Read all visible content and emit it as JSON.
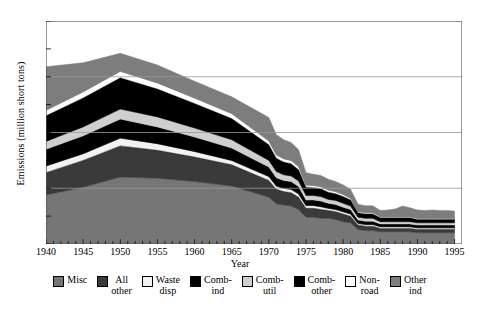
{
  "chart_data": {
    "type": "area",
    "stacked": true,
    "title": "",
    "xlabel": "Year",
    "ylabel": "Emissions (million short tons)",
    "xlim": [
      1940,
      1996
    ],
    "ylim": [
      0,
      20
    ],
    "yticks": [
      0,
      5,
      10,
      15,
      20
    ],
    "xticks": [
      1940,
      1945,
      1950,
      1955,
      1960,
      1965,
      1970,
      1975,
      1980,
      1985,
      1990,
      1995
    ],
    "grid": true,
    "legend_position": "bottom",
    "x": [
      1940,
      1945,
      1950,
      1955,
      1960,
      1965,
      1970,
      1971,
      1972,
      1973,
      1974,
      1975,
      1976,
      1977,
      1978,
      1979,
      1980,
      1981,
      1982,
      1983,
      1984,
      1985,
      1986,
      1987,
      1988,
      1989,
      1990,
      1991,
      1992,
      1993,
      1994,
      1995
    ],
    "series": [
      {
        "name": "Misc",
        "color": "#767676",
        "values": [
          4.4,
          5.1,
          6.0,
          5.9,
          5.6,
          5.2,
          4.2,
          3.6,
          3.5,
          3.4,
          3.1,
          2.4,
          2.4,
          2.3,
          2.3,
          2.2,
          2.0,
          1.9,
          1.3,
          1.2,
          1.2,
          1.1,
          1.1,
          1.1,
          1.1,
          1.1,
          1.0,
          1.0,
          1.0,
          1.0,
          1.0,
          1.0
        ]
      },
      {
        "name": "All other",
        "color": "#3a3a3a",
        "values": [
          2.0,
          2.4,
          2.8,
          2.5,
          2.2,
          1.9,
          1.5,
          1.3,
          1.2,
          1.2,
          1.1,
          0.8,
          0.8,
          0.8,
          0.7,
          0.7,
          0.7,
          0.6,
          0.4,
          0.4,
          0.4,
          0.3,
          0.3,
          0.3,
          0.3,
          0.3,
          0.3,
          0.3,
          0.3,
          0.3,
          0.3,
          0.3
        ]
      },
      {
        "name": "Waste disp",
        "color": "#f2f2f2",
        "values": [
          0.6,
          0.6,
          0.7,
          0.6,
          0.5,
          0.4,
          0.35,
          0.3,
          0.3,
          0.3,
          0.3,
          0.25,
          0.25,
          0.25,
          0.2,
          0.2,
          0.2,
          0.2,
          0.15,
          0.15,
          0.15,
          0.15,
          0.15,
          0.15,
          0.15,
          0.15,
          0.15,
          0.15,
          0.15,
          0.15,
          0.15,
          0.15
        ]
      },
      {
        "name": "Comb-ind",
        "color": "#000000",
        "values": [
          1.5,
          1.6,
          1.7,
          1.5,
          1.3,
          1.1,
          0.85,
          0.75,
          0.7,
          0.7,
          0.65,
          0.5,
          0.5,
          0.5,
          0.45,
          0.45,
          0.4,
          0.4,
          0.3,
          0.3,
          0.3,
          0.25,
          0.25,
          0.25,
          0.25,
          0.25,
          0.25,
          0.25,
          0.25,
          0.25,
          0.25,
          0.25
        ]
      },
      {
        "name": "Comb-util",
        "color": "#cfcfcf",
        "values": [
          0.7,
          0.8,
          0.9,
          0.9,
          0.8,
          0.75,
          0.6,
          0.55,
          0.5,
          0.5,
          0.5,
          0.4,
          0.4,
          0.4,
          0.35,
          0.35,
          0.35,
          0.3,
          0.25,
          0.25,
          0.25,
          0.2,
          0.2,
          0.2,
          0.2,
          0.2,
          0.2,
          0.2,
          0.2,
          0.2,
          0.2,
          0.2
        ]
      },
      {
        "name": "Comb-other",
        "color": "#000000",
        "values": [
          2.3,
          2.6,
          2.8,
          2.5,
          2.2,
          1.9,
          1.4,
          1.2,
          1.15,
          1.1,
          1.0,
          0.75,
          0.7,
          0.7,
          0.65,
          0.6,
          0.6,
          0.55,
          0.4,
          0.4,
          0.4,
          0.35,
          0.35,
          0.35,
          0.35,
          0.35,
          0.3,
          0.3,
          0.3,
          0.3,
          0.3,
          0.3
        ]
      },
      {
        "name": "Non-road",
        "color": "#ffffff",
        "values": [
          0.5,
          0.55,
          0.6,
          0.55,
          0.5,
          0.45,
          0.35,
          0.3,
          0.3,
          0.3,
          0.3,
          0.2,
          0.2,
          0.2,
          0.2,
          0.2,
          0.2,
          0.15,
          0.12,
          0.12,
          0.12,
          0.1,
          0.1,
          0.1,
          0.1,
          0.1,
          0.1,
          0.1,
          0.1,
          0.1,
          0.1,
          0.1
        ]
      },
      {
        "name": "Other ind",
        "color": "#7d7d7d",
        "values": [
          3.9,
          2.6,
          1.6,
          1.6,
          1.5,
          1.5,
          2.1,
          1.8,
          1.7,
          1.6,
          1.5,
          1.1,
          1.0,
          1.0,
          0.95,
          0.9,
          0.85,
          0.8,
          0.65,
          0.6,
          0.6,
          0.55,
          0.6,
          0.7,
          0.95,
          0.8,
          0.75,
          0.7,
          0.75,
          0.7,
          0.7,
          0.65
        ]
      }
    ]
  },
  "legend": {
    "items": [
      {
        "label": "Misc",
        "lines": [
          "Misc"
        ],
        "color": "#767676"
      },
      {
        "label": "All other",
        "lines": [
          "All",
          "other"
        ],
        "color": "#3a3a3a"
      },
      {
        "label": "Waste disp",
        "lines": [
          "Waste",
          "disp"
        ],
        "color": "#f2f2f2"
      },
      {
        "label": "Comb-ind",
        "lines": [
          "Comb-",
          "ind"
        ],
        "color": "#000000"
      },
      {
        "label": "Comb-util",
        "lines": [
          "Comb-",
          "util"
        ],
        "color": "#cfcfcf"
      },
      {
        "label": "Comb-other",
        "lines": [
          "Comb-",
          "other"
        ],
        "color": "#000000"
      },
      {
        "label": "Non-road",
        "lines": [
          "Non-",
          "road"
        ],
        "color": "#ffffff"
      },
      {
        "label": "Other ind",
        "lines": [
          "Other",
          "ind"
        ],
        "color": "#7d7d7d"
      }
    ]
  },
  "axis_style": {
    "frame_color": "#555555",
    "grid_color": "#999999"
  }
}
